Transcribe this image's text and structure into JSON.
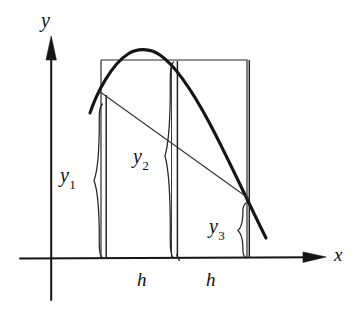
{
  "figure": {
    "kind": "math-diagram",
    "background_color": "#ffffff",
    "ink_color": "#101010",
    "thin_ink_color": "#2a2a2a"
  },
  "axes": {
    "x_label": "x",
    "y_label": "y",
    "x_axis": {
      "x1": 20,
      "y1": 258,
      "x2": 326,
      "y2": 257,
      "arrow": "right"
    },
    "y_axis": {
      "x1": 51,
      "y1": 300,
      "x2": 51,
      "y2": 36,
      "arrow": "up"
    }
  },
  "rectangle": {
    "left": 101,
    "right": 247,
    "top": 60,
    "bottom": 258
  },
  "ordinates": [
    {
      "name": "y1",
      "label": "y",
      "subscript": "1",
      "x": 106,
      "top": 95,
      "bottom": 258,
      "brace_x": 99,
      "brace_top": 104,
      "brace_bottom": 258
    },
    {
      "name": "y2",
      "label": "y",
      "subscript": "2",
      "x": 177,
      "top": 61,
      "bottom": 258,
      "brace_x": 170,
      "brace_top": 62,
      "brace_bottom": 258
    },
    {
      "name": "y3",
      "label": "y",
      "subscript": "3",
      "x": 249,
      "top": 60,
      "bottom": 258,
      "brace_x": 242,
      "brace_top": 203,
      "brace_bottom": 258
    }
  ],
  "spacings": [
    {
      "name": "h-left",
      "label": "h",
      "from_x": 106,
      "to_x": 177
    },
    {
      "name": "h-right",
      "label": "h",
      "from_x": 177,
      "to_x": 249
    }
  ],
  "parabola": {
    "stroke_width": 3.0,
    "start": {
      "x": 90,
      "y": 112
    },
    "apex": {
      "x": 142,
      "y": 50
    },
    "end": {
      "x": 266,
      "y": 238
    }
  },
  "chord": {
    "name": "secant-line",
    "stroke_width": 1.0,
    "start": {
      "x": 100,
      "y": 92
    },
    "end": {
      "x": 249,
      "y": 199
    }
  }
}
